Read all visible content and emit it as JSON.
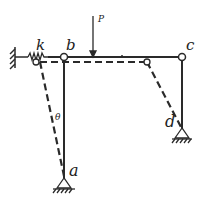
{
  "diagram": {
    "type": "structural-frame-mechanism",
    "labels": {
      "k": "k",
      "b": "b",
      "c": "c",
      "a": "a",
      "d": "d",
      "P": "P",
      "theta": "θ"
    },
    "colors": {
      "line": "#2a2a2a",
      "background": "#ffffff"
    },
    "elements": {
      "fixed_wall": "left fixed wall with hatching",
      "spring": "spring k connecting wall to node",
      "load": "vertical point load P on beam bc",
      "supports": [
        "pin support at a",
        "pin support at d"
      ],
      "deformed_shape": "dashed lines showing displaced configuration rotated by θ"
    }
  }
}
